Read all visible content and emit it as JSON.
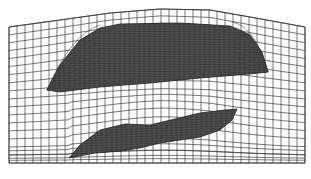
{
  "figure": {
    "type": "structured-computational-mesh",
    "colors": {
      "background": "#ffffff",
      "grid_line": "#3a3a3a",
      "body_fill": "#4a4a4a",
      "body_mesh": "#222222"
    },
    "domain": {
      "left_x": 9,
      "right_x": 305,
      "bottom_y": 163,
      "top_boundary": [
        [
          9,
          27
        ],
        [
          60,
          20
        ],
        [
          110,
          13
        ],
        [
          160,
          9
        ],
        [
          210,
          10
        ],
        [
          250,
          17
        ],
        [
          305,
          27
        ]
      ]
    },
    "bodies": [
      {
        "name": "upper-body",
        "outline": [
          [
            47,
            90
          ],
          [
            60,
            65
          ],
          [
            80,
            40
          ],
          [
            100,
            28
          ],
          [
            120,
            24
          ],
          [
            180,
            23
          ],
          [
            230,
            26
          ],
          [
            250,
            35
          ],
          [
            262,
            52
          ],
          [
            268,
            72
          ],
          [
            250,
            74
          ],
          [
            200,
            78
          ],
          [
            150,
            83
          ],
          [
            100,
            87
          ],
          [
            60,
            92
          ]
        ]
      },
      {
        "name": "lower-body",
        "outline": [
          [
            69,
            158
          ],
          [
            80,
            145
          ],
          [
            100,
            130
          ],
          [
            125,
            124
          ],
          [
            150,
            125
          ],
          [
            175,
            119
          ],
          [
            200,
            113
          ],
          [
            225,
            110
          ],
          [
            237,
            109
          ],
          [
            232,
            120
          ],
          [
            220,
            130
          ],
          [
            200,
            137
          ],
          [
            180,
            140
          ],
          [
            160,
            143
          ],
          [
            140,
            148
          ],
          [
            120,
            151
          ],
          [
            95,
            153
          ],
          [
            69,
            158
          ]
        ]
      }
    ],
    "grid": {
      "cell_size_px": 8,
      "columns": 37,
      "rows": 17
    }
  }
}
